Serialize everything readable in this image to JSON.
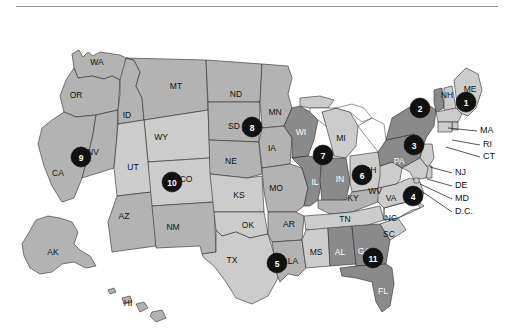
{
  "figure": {
    "type": "choropleth-map",
    "region": "United States",
    "background_color": "#ffffff",
    "has_top_rule": true,
    "border_color": "#2b2b2b"
  },
  "legend_shades": {
    "light": "#cccccc",
    "medium": "#b3b3b3",
    "dark": "#8a8a8a",
    "white": "#fafafa",
    "marker_fill": "#111111",
    "marker_text": "#ffffff"
  },
  "states": [
    {
      "id": "WA",
      "label": "WA",
      "shade": "medium",
      "lx": 97,
      "ly": 47
    },
    {
      "id": "OR",
      "label": "OR",
      "shade": "medium",
      "lx": 76,
      "ly": 80
    },
    {
      "id": "CA",
      "label": "CA",
      "shade": "medium",
      "lx": 58,
      "ly": 158
    },
    {
      "id": "NV",
      "label": "NV",
      "shade": "medium",
      "lx": 93,
      "ly": 137
    },
    {
      "id": "ID",
      "label": "ID",
      "shade": "medium",
      "lx": 127,
      "ly": 100
    },
    {
      "id": "MT",
      "label": "MT",
      "shade": "medium",
      "lx": 176,
      "ly": 71
    },
    {
      "id": "WY",
      "label": "WY",
      "shade": "light",
      "lx": 161,
      "ly": 122
    },
    {
      "id": "UT",
      "label": "UT",
      "shade": "light",
      "lx": 133,
      "ly": 152
    },
    {
      "id": "AZ",
      "label": "AZ",
      "shade": "medium",
      "lx": 124,
      "ly": 201
    },
    {
      "id": "CO",
      "label": "CO",
      "shade": "light",
      "lx": 186,
      "ly": 164
    },
    {
      "id": "NM",
      "label": "NM",
      "shade": "medium",
      "lx": 173,
      "ly": 212
    },
    {
      "id": "ND",
      "label": "ND",
      "shade": "medium",
      "lx": 236,
      "ly": 79
    },
    {
      "id": "SD",
      "label": "SD",
      "shade": "medium",
      "lx": 234,
      "ly": 111
    },
    {
      "id": "NE",
      "label": "NE",
      "shade": "medium",
      "lx": 231,
      "ly": 146
    },
    {
      "id": "KS",
      "label": "KS",
      "shade": "light",
      "lx": 239,
      "ly": 180
    },
    {
      "id": "OK",
      "label": "OK",
      "shade": "light",
      "lx": 248,
      "ly": 210
    },
    {
      "id": "TX",
      "label": "TX",
      "shade": "light",
      "lx": 232,
      "ly": 245
    },
    {
      "id": "MN",
      "label": "MN",
      "shade": "medium",
      "lx": 275,
      "ly": 97
    },
    {
      "id": "IA",
      "label": "IA",
      "shade": "medium",
      "lx": 272,
      "ly": 133
    },
    {
      "id": "MO",
      "label": "MO",
      "shade": "medium",
      "lx": 276,
      "ly": 173
    },
    {
      "id": "AR",
      "label": "AR",
      "shade": "medium",
      "lx": 289,
      "ly": 209
    },
    {
      "id": "LA",
      "label": "LA",
      "shade": "medium",
      "lx": 293,
      "ly": 246
    },
    {
      "id": "WI",
      "label": "WI",
      "shade": "dark",
      "lx": 301,
      "ly": 117
    },
    {
      "id": "IL",
      "label": "IL",
      "shade": "dark",
      "lx": 315,
      "ly": 167
    },
    {
      "id": "MI",
      "label": "MI",
      "shade": "light",
      "lx": 341,
      "ly": 123
    },
    {
      "id": "IN",
      "label": "IN",
      "shade": "dark",
      "lx": 340,
      "ly": 164
    },
    {
      "id": "OH",
      "label": "OH",
      "shade": "light",
      "lx": 370,
      "ly": 155
    },
    {
      "id": "KY",
      "label": "KY",
      "shade": "medium",
      "lx": 353,
      "ly": 183
    },
    {
      "id": "TN",
      "label": "TN",
      "shade": "light",
      "lx": 345,
      "ly": 204
    },
    {
      "id": "MS",
      "label": "MS",
      "shade": "light",
      "lx": 316,
      "ly": 237
    },
    {
      "id": "AL",
      "label": "AL",
      "shade": "dark",
      "lx": 340,
      "ly": 237
    },
    {
      "id": "GA",
      "label": "GA",
      "shade": "dark",
      "lx": 364,
      "ly": 236
    },
    {
      "id": "FL",
      "label": "FL",
      "shade": "dark",
      "lx": 383,
      "ly": 276
    },
    {
      "id": "SC",
      "label": "SC",
      "shade": "light",
      "lx": 389,
      "ly": 219
    },
    {
      "id": "NC",
      "label": "NC",
      "shade": "light",
      "lx": 391,
      "ly": 203
    },
    {
      "id": "VA",
      "label": "VA",
      "shade": "light",
      "lx": 391,
      "ly": 183
    },
    {
      "id": "WV",
      "label": "WV",
      "shade": "light",
      "lx": 375,
      "ly": 176
    },
    {
      "id": "PA",
      "label": "PA",
      "shade": "dark",
      "lx": 399,
      "ly": 146
    },
    {
      "id": "NY",
      "label": "NY",
      "shade": "dark",
      "lx": 413,
      "ly": 129
    },
    {
      "id": "VT",
      "label": "VT",
      "shade": "dark",
      "lx": 428,
      "ly": 83
    },
    {
      "id": "NH",
      "label": "NH",
      "shade": "light",
      "lx": 447,
      "ly": 80
    },
    {
      "id": "ME",
      "label": "ME",
      "shade": "light",
      "lx": 470,
      "ly": 74
    },
    {
      "id": "AK",
      "label": "AK",
      "shade": "medium",
      "lx": 53,
      "ly": 237
    },
    {
      "id": "HI",
      "label": "HI",
      "shade": "medium",
      "lx": 128,
      "ly": 288
    }
  ],
  "callouts": [
    {
      "id": "MA",
      "label": "MA",
      "tx": 480,
      "ty": 115,
      "lx1": 477,
      "ly1": 115,
      "lx2": 448,
      "ly2": 112
    },
    {
      "id": "RI",
      "label": "RI",
      "tx": 483,
      "ty": 129,
      "lx1": 480,
      "ly1": 129,
      "lx2": 452,
      "ly2": 124
    },
    {
      "id": "CT",
      "label": "CT",
      "tx": 483,
      "ty": 141,
      "lx1": 480,
      "ly1": 141,
      "lx2": 446,
      "ly2": 131
    },
    {
      "id": "NJ",
      "label": "NJ",
      "tx": 455,
      "ty": 157,
      "lx1": 452,
      "ly1": 157,
      "lx2": 430,
      "ly2": 151
    },
    {
      "id": "DE",
      "label": "DE",
      "tx": 455,
      "ty": 170,
      "lx1": 452,
      "ly1": 170,
      "lx2": 427,
      "ly2": 163
    },
    {
      "id": "MD",
      "label": "MD",
      "tx": 455,
      "ty": 183,
      "lx1": 452,
      "ly1": 183,
      "lx2": 420,
      "ly2": 168
    },
    {
      "id": "D.C.",
      "label": "D.C.",
      "tx": 455,
      "ty": 196,
      "lx1": 452,
      "ly1": 196,
      "lx2": 417,
      "ly2": 172
    }
  ],
  "markers": [
    {
      "number": "1",
      "x": 466,
      "y": 86,
      "r": 10
    },
    {
      "number": "2",
      "x": 420,
      "y": 92,
      "r": 10
    },
    {
      "number": "3",
      "x": 414,
      "y": 129,
      "r": 10
    },
    {
      "number": "4",
      "x": 413,
      "y": 180,
      "r": 10
    },
    {
      "number": "5",
      "x": 277,
      "y": 247,
      "r": 10
    },
    {
      "number": "6",
      "x": 362,
      "y": 159,
      "r": 10
    },
    {
      "number": "7",
      "x": 323,
      "y": 139,
      "r": 10
    },
    {
      "number": "8",
      "x": 252,
      "y": 111,
      "r": 10
    },
    {
      "number": "9",
      "x": 81,
      "y": 141,
      "r": 10
    },
    {
      "number": "10",
      "x": 172,
      "y": 166,
      "r": 10
    },
    {
      "number": "11",
      "x": 373,
      "y": 242,
      "r": 10
    }
  ]
}
